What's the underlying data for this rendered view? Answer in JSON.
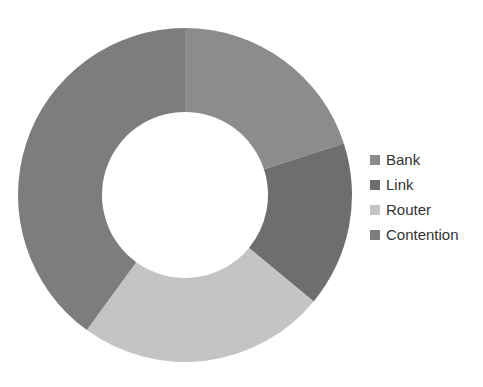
{
  "chart_data": {
    "type": "pie",
    "subtype": "donut",
    "title": "",
    "categories": [
      "Bank",
      "Link",
      "Router",
      "Contention"
    ],
    "values": [
      20,
      16,
      24,
      40
    ],
    "unit": "percent (estimated from slice angles)",
    "colors": [
      "#8c8c8c",
      "#6e6e6e",
      "#c4c4c4",
      "#7d7d7d"
    ],
    "start_angle_deg": 0,
    "direction": "clockwise",
    "legend_position": "right"
  },
  "legend": {
    "items": [
      {
        "label": "Bank",
        "color": "#8c8c8c"
      },
      {
        "label": "Link",
        "color": "#6e6e6e"
      },
      {
        "label": "Router",
        "color": "#c4c4c4"
      },
      {
        "label": "Contention",
        "color": "#7d7d7d"
      }
    ]
  }
}
